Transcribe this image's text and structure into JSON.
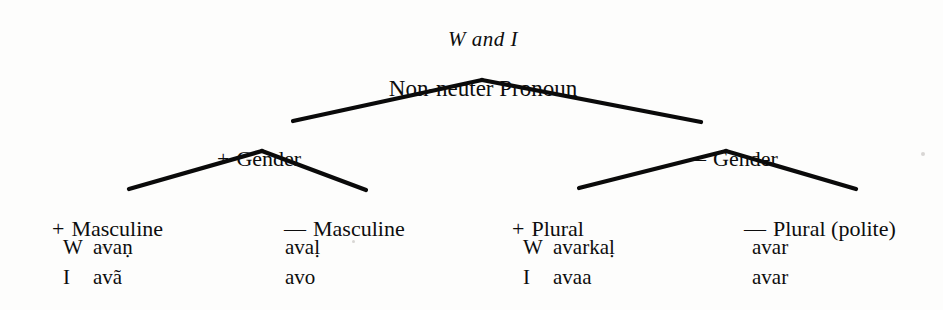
{
  "figure": {
    "title": "W and I",
    "root": {
      "label": "Non-neuter Pronoun"
    },
    "level2": [
      {
        "sign": "+",
        "label": "Gender"
      },
      {
        "sign": "—",
        "label": "Gender"
      }
    ],
    "leaves": [
      {
        "sign": "+",
        "label": "Masculine",
        "forms": [
          {
            "lang": "W",
            "form": "avaṇ"
          },
          {
            "lang": "I",
            "form": "avã"
          }
        ]
      },
      {
        "sign": "—",
        "label": "Masculine",
        "forms": [
          {
            "lang": "",
            "form": "avaḷ"
          },
          {
            "lang": "",
            "form": "avo"
          }
        ]
      },
      {
        "sign": "+",
        "label": "Plural",
        "forms": [
          {
            "lang": "W",
            "form": "avarkaḷ"
          },
          {
            "lang": "I",
            "form": "avaa"
          }
        ]
      },
      {
        "sign": "—",
        "label": "Plural (polite)",
        "forms": [
          {
            "lang": "",
            "form": "avar"
          },
          {
            "lang": "",
            "form": "avar"
          }
        ]
      }
    ],
    "colors": {
      "ink": "#0d0d0d",
      "line": "#0a0a0a",
      "background": "#fdfdfc"
    }
  }
}
